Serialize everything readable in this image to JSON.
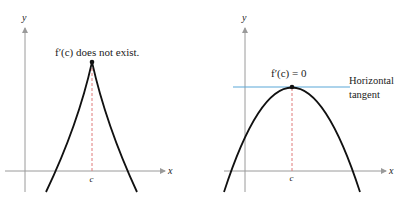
{
  "figure": {
    "left_graph": {
      "annotation": "f′(c) does not exist.",
      "x_axis_label": "x",
      "y_axis_label": "y",
      "x_tick_label": "c",
      "curve_type": "cusp"
    },
    "right_graph": {
      "annotation": "f′(c) = 0",
      "tangent_label_line1": "Horizontal",
      "tangent_label_line2": "tangent",
      "x_axis_label": "x",
      "y_axis_label": "y",
      "x_tick_label": "c",
      "curve_type": "downward parabola"
    }
  },
  "colors": {
    "axis": "#9a9a9a",
    "curve": "#111111",
    "dashed_line": "#e07a7a",
    "tangent_line": "#5aa8d8",
    "text": "#222222"
  }
}
